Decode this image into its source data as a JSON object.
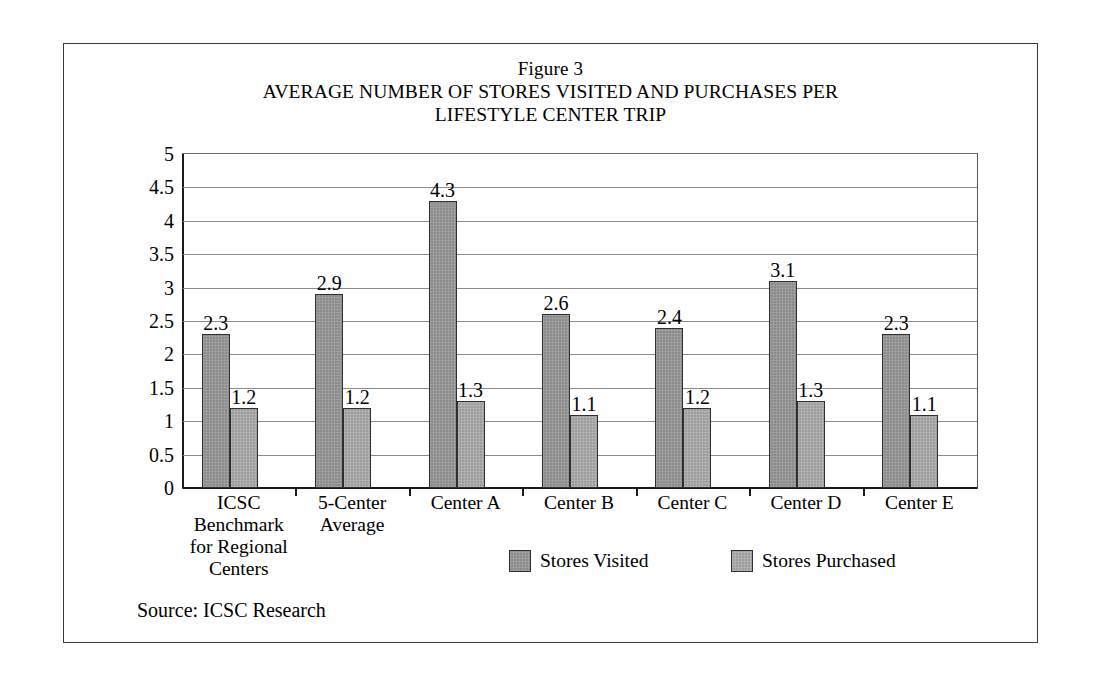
{
  "figure": {
    "number_label": "Figure 3",
    "title_lines": [
      "AVERAGE NUMBER OF STORES VISITED AND PURCHASES PER",
      "LIFESTYLE CENTER TRIP"
    ],
    "source_note": "Source: ICSC Research"
  },
  "colors": {
    "series_visited": "#8b8b8b",
    "series_purchased": "#9d9d9d",
    "bar_outline": "#2e2e2e",
    "gridline": "#8a8a8e",
    "axis": "#1a1a1a",
    "frame": "#3a3a3a",
    "background": "#ffffff",
    "text": "#000000"
  },
  "chart_data": {
    "type": "bar",
    "subtitle": "Figure 3",
    "xlabel": "",
    "ylabel": "",
    "ylim": [
      0,
      5
    ],
    "ytick_labels": [
      "5",
      "4.5",
      "4",
      "3.5",
      "3",
      "2.5",
      "2",
      "1.5",
      "1",
      "0.5",
      "0"
    ],
    "ytick_values": [
      5,
      4.5,
      4,
      3.5,
      3,
      2.5,
      2,
      1.5,
      1,
      0.5,
      0
    ],
    "grid": true,
    "grid_axis": "y",
    "legend_position": "bottom",
    "categories": [
      "ICSC Benchmark for Regional Centers",
      "5-Center Average",
      "Center A",
      "Center B",
      "Center C",
      "Center D",
      "Center E"
    ],
    "category_label_lines": [
      [
        "ICSC",
        "Benchmark",
        "for Regional",
        "Centers"
      ],
      [
        "5-Center",
        "Average"
      ],
      [
        "Center A"
      ],
      [
        "Center B"
      ],
      [
        "Center C"
      ],
      [
        "Center D"
      ],
      [
        "Center E"
      ]
    ],
    "series": [
      {
        "name": "Stores Visited",
        "color": "#8b8b8b",
        "values": [
          2.3,
          2.9,
          4.3,
          2.6,
          2.4,
          3.1,
          2.3
        ],
        "labels": [
          "2.3",
          "2.9",
          "4.3",
          "2.6",
          "2.4",
          "3.1",
          "2.3"
        ]
      },
      {
        "name": "Stores Purchased",
        "color": "#9d9d9d",
        "values": [
          1.2,
          1.2,
          1.3,
          1.1,
          1.2,
          1.3,
          1.1
        ],
        "labels": [
          "1.2",
          "1.2",
          "1.3",
          "1.1",
          "1.2",
          "1.3",
          "1.1"
        ]
      }
    ]
  },
  "legend": [
    {
      "label": "Stores Visited",
      "swatch": "series-0"
    },
    {
      "label": "Stores Purchased",
      "swatch": "series-1"
    }
  ]
}
